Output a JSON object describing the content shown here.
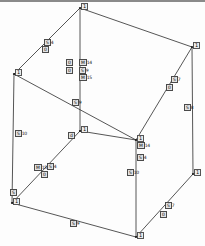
{
  "figure": {
    "type": "wireframe-cube-diagram",
    "title": "",
    "background": "#fdfdfd",
    "edge_color": "#2b2b2b",
    "label_color": "#111111"
  },
  "vertices": [
    {
      "id": "v-top",
      "label": "1",
      "x": 80,
      "y": 8
    },
    {
      "id": "v-left-upper",
      "label": "1",
      "x": 14,
      "y": 74
    },
    {
      "id": "v-right-upper",
      "label": "1",
      "x": 192,
      "y": 47
    },
    {
      "id": "v-center-hidden",
      "label": "1",
      "x": 80,
      "y": 131
    },
    {
      "id": "v-left-lower",
      "label": "1",
      "x": 12,
      "y": 203
    },
    {
      "id": "v-right-lower",
      "label": "1",
      "x": 193,
      "y": 174
    },
    {
      "id": "v-bottom",
      "label": "1",
      "x": 136,
      "y": 237
    },
    {
      "id": "v-front-mid",
      "label": "1",
      "x": 136,
      "y": 140
    }
  ],
  "edge_labels": [
    {
      "id": "lbl-top-left-a",
      "sym": "S",
      "num": "4",
      "x": 44,
      "y": 40
    },
    {
      "id": "lbl-top-left-b",
      "sym": "0",
      "num": "",
      "x": 42,
      "y": 47
    },
    {
      "id": "lbl-mid-col-a",
      "sym": "0",
      "num": "",
      "x": 66,
      "y": 60
    },
    {
      "id": "lbl-mid-col-b",
      "sym": "0",
      "num": "",
      "x": 66,
      "y": 68
    },
    {
      "id": "lbl-mid-stack-1",
      "sym": "M",
      "num": "14",
      "x": 79,
      "y": 60
    },
    {
      "id": "lbl-mid-stack-2",
      "sym": "S",
      "num": "9",
      "x": 79,
      "y": 68
    },
    {
      "id": "lbl-mid-stack-3",
      "sym": "M",
      "num": "15",
      "x": 79,
      "y": 75
    },
    {
      "id": "lbl-right-upper-a",
      "sym": "S",
      "num": "7",
      "x": 171,
      "y": 77
    },
    {
      "id": "lbl-right-upper-b",
      "sym": "0",
      "num": "",
      "x": 166,
      "y": 85
    },
    {
      "id": "lbl-right-vert",
      "sym": "S",
      "num": "8",
      "x": 184,
      "y": 105
    },
    {
      "id": "lbl-center-vert",
      "sym": "S",
      "num": "9",
      "x": 72,
      "y": 100
    },
    {
      "id": "lbl-left-vert",
      "sym": "S",
      "num": "10",
      "x": 15,
      "y": 131
    },
    {
      "id": "lbl-hidden-tag",
      "sym": "d",
      "num": "",
      "x": 68,
      "y": 133
    },
    {
      "id": "lbl-front-vert-a",
      "sym": "M",
      "num": "14",
      "x": 137,
      "y": 143
    },
    {
      "id": "lbl-front-vert-b",
      "sym": "S",
      "num": "4",
      "x": 137,
      "y": 155
    },
    {
      "id": "lbl-front-vert-c",
      "sym": "S",
      "num": "10",
      "x": 127,
      "y": 170
    },
    {
      "id": "lbl-lower-left-a",
      "sym": "M",
      "num": "15",
      "x": 34,
      "y": 165
    },
    {
      "id": "lbl-lower-left-b",
      "sym": "S",
      "num": "4",
      "x": 47,
      "y": 164
    },
    {
      "id": "lbl-lower-left-c",
      "sym": "0",
      "num": "",
      "x": 41,
      "y": 172
    },
    {
      "id": "lbl-left-bottom",
      "sym": "S",
      "num": "",
      "x": 10,
      "y": 190
    },
    {
      "id": "lbl-bottom-edge",
      "sym": "S",
      "num": "9",
      "x": 70,
      "y": 221
    },
    {
      "id": "lbl-right-bottom-a",
      "sym": "S",
      "num": "7",
      "x": 165,
      "y": 203
    },
    {
      "id": "lbl-right-bottom-b",
      "sym": "0",
      "num": "",
      "x": 160,
      "y": 212
    }
  ],
  "edges": [
    {
      "id": "e-top-leftupper",
      "from": "v-top",
      "to": "v-left-upper"
    },
    {
      "id": "e-top-rightupper",
      "from": "v-top",
      "to": "v-right-upper"
    },
    {
      "id": "e-top-center",
      "from": "v-top",
      "to": "v-center-hidden"
    },
    {
      "id": "e-leftupper-leftlow",
      "from": "v-left-upper",
      "to": "v-left-lower"
    },
    {
      "id": "e-leftupper-center",
      "from": "v-left-upper",
      "to": "v-front-mid"
    },
    {
      "id": "e-rightupper-rlow",
      "from": "v-right-upper",
      "to": "v-right-lower"
    },
    {
      "id": "e-rightupper-front",
      "from": "v-right-upper",
      "to": "v-front-mid"
    },
    {
      "id": "e-center-leftlow",
      "from": "v-center-hidden",
      "to": "v-left-lower"
    },
    {
      "id": "e-center-front",
      "from": "v-center-hidden",
      "to": "v-front-mid"
    },
    {
      "id": "e-leftlow-bottom",
      "from": "v-left-lower",
      "to": "v-bottom"
    },
    {
      "id": "e-rightlow-bottom",
      "from": "v-right-lower",
      "to": "v-bottom"
    },
    {
      "id": "e-front-bottom",
      "from": "v-front-mid",
      "to": "v-bottom"
    }
  ]
}
